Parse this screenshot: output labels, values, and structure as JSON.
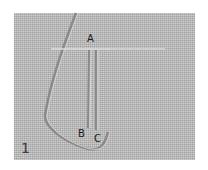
{
  "figure": {
    "number": "1",
    "labels": {
      "a": "A",
      "b": "B",
      "c": "C"
    },
    "colors": {
      "fabric": "#b8b8b8",
      "thread_light": "#dcdcdc",
      "fold_shadow": "#8a8a8a"
    }
  }
}
